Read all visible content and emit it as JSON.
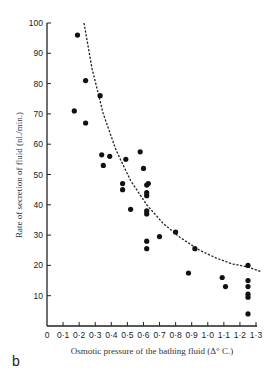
{
  "panel_label": "b",
  "chart_data": {
    "type": "scatter",
    "title": "",
    "xlabel": "Osmotic pressure of the bathing fluid (Δ° C.)",
    "ylabel": "Rate of secretion of fluid (nl./min.)",
    "xlim": [
      0,
      1.3
    ],
    "ylim": [
      0,
      100
    ],
    "x_ticks": [
      0,
      0.1,
      0.2,
      0.3,
      0.4,
      0.5,
      0.6,
      0.7,
      0.8,
      0.9,
      1.0,
      1.1,
      1.2,
      1.3
    ],
    "x_tick_labels": [
      "0",
      "0·1",
      "0·2",
      "0·3",
      "0·4",
      "0·5",
      "0·6",
      "0·7",
      "0·8",
      "0·9",
      "1·0",
      "1·1",
      "1·2",
      "1·3"
    ],
    "y_ticks": [
      10,
      20,
      30,
      40,
      50,
      60,
      70,
      80,
      90,
      100
    ],
    "y_tick_labels": [
      "10",
      "20",
      "30",
      "40",
      "50",
      "60",
      "70",
      "80",
      "90",
      "100"
    ],
    "grid": false,
    "legend": null,
    "series": [
      {
        "name": "observations",
        "marker": "filled-circle",
        "color": "#111111",
        "points": [
          [
            0.19,
            96
          ],
          [
            0.24,
            81
          ],
          [
            0.33,
            76
          ],
          [
            0.17,
            71
          ],
          [
            0.24,
            67
          ],
          [
            0.34,
            56.5
          ],
          [
            0.35,
            53
          ],
          [
            0.39,
            56
          ],
          [
            0.49,
            55
          ],
          [
            0.47,
            47
          ],
          [
            0.47,
            45
          ],
          [
            0.52,
            38.5
          ],
          [
            0.58,
            57.5
          ],
          [
            0.6,
            52
          ],
          [
            0.62,
            46.5
          ],
          [
            0.63,
            47
          ],
          [
            0.62,
            44
          ],
          [
            0.62,
            43
          ],
          [
            0.62,
            38
          ],
          [
            0.62,
            37
          ],
          [
            0.62,
            28
          ],
          [
            0.62,
            25.5
          ],
          [
            0.7,
            29.5
          ],
          [
            0.8,
            31
          ],
          [
            0.92,
            25.5
          ],
          [
            0.88,
            17.5
          ],
          [
            1.09,
            16
          ],
          [
            1.11,
            13
          ],
          [
            1.25,
            20
          ],
          [
            1.25,
            15
          ],
          [
            1.25,
            13
          ],
          [
            1.25,
            10.5
          ],
          [
            1.25,
            9.5
          ],
          [
            1.25,
            4
          ]
        ]
      },
      {
        "name": "fitted curve",
        "style": "dashed",
        "color": "#222222",
        "points": [
          [
            0.23,
            100
          ],
          [
            0.28,
            85
          ],
          [
            0.35,
            70
          ],
          [
            0.43,
            58
          ],
          [
            0.52,
            48
          ],
          [
            0.62,
            40
          ],
          [
            0.72,
            34
          ],
          [
            0.82,
            29.5
          ],
          [
            0.95,
            25
          ],
          [
            1.05,
            22.5
          ],
          [
            1.15,
            20.5
          ],
          [
            1.25,
            19.5
          ],
          [
            1.33,
            18
          ]
        ]
      }
    ]
  }
}
